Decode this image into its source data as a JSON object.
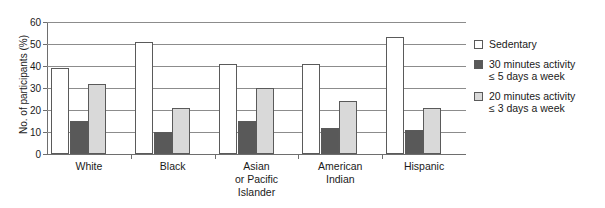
{
  "chart_data": {
    "type": "bar",
    "title": "",
    "xlabel": "",
    "ylabel": "No. of participants (%)",
    "ylim": [
      0,
      60
    ],
    "yticks": [
      0,
      10,
      20,
      30,
      40,
      50,
      60
    ],
    "grid": "horizontal",
    "legend_position": "right",
    "categories": [
      "White",
      "Black",
      "Asian\nor Pacific\nIslander",
      "American\nIndian",
      "Hispanic"
    ],
    "series": [
      {
        "name": "Sedentary",
        "color": "#ffffff",
        "values": [
          39,
          51,
          41,
          41,
          53
        ]
      },
      {
        "name": "30 minutes activity\n≤ 5 days a week",
        "color": "#595959",
        "values": [
          15,
          10,
          15,
          12,
          11
        ]
      },
      {
        "name": "20 minutes activity\n≤ 3 days a week",
        "color": "#d9d9d9",
        "values": [
          32,
          21,
          30,
          24,
          21
        ]
      }
    ]
  },
  "axis": {
    "y_title": "No. of participants (%)",
    "tick_labels": [
      "60",
      "50",
      "40",
      "30",
      "20",
      "10",
      "0"
    ]
  },
  "legend": {
    "items": [
      {
        "label": "Sedentary"
      },
      {
        "label": "30 minutes activity\n≤ 5 days a week"
      },
      {
        "label": "20 minutes activity\n≤ 3 days a week"
      }
    ]
  }
}
